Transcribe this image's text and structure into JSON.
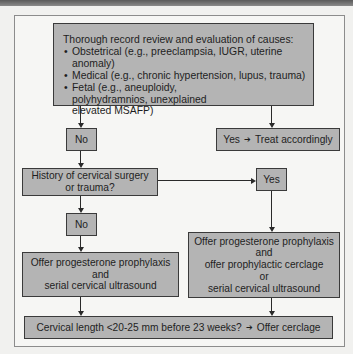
{
  "flowchart": {
    "evaluation": {
      "title": "Thorough record review and evaluation of causes:",
      "causes": [
        "Obstetrical (e.g., preeclampsia, IUGR, uterine anomaly)",
        "Medical (e.g., chronic hypertension, lupus, trauma)",
        "Fetal (e.g., aneuploidy, polyhydramnios, unexplained elevated MSAFP)"
      ]
    },
    "no_1": "No",
    "treat": {
      "yes": "Yes",
      "arrow": "➔",
      "action": "Treat accordingly"
    },
    "question": {
      "line1": "History of cervical surgery",
      "line2": "or trauma?"
    },
    "yes_2": "Yes",
    "no_2": "No",
    "left_offer": {
      "line1": "Offer progesterone prophylaxis",
      "line2": "and",
      "line3": "serial cervical ultrasound"
    },
    "right_offer": {
      "line1": "Offer progesterone prophylaxis",
      "line2": "and",
      "line3": "offer prophylactic cerclage",
      "line4": "or",
      "line5": "serial cervical ultrasound"
    },
    "final": {
      "condition": "Cervical length <20-25 mm before 23 weeks?",
      "arrow": "➔",
      "action": "Offer cerclage"
    }
  }
}
